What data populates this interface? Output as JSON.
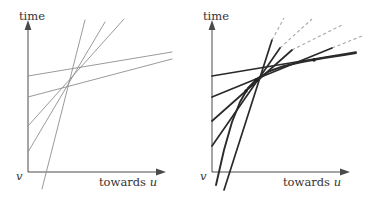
{
  "figure": {
    "panels": [
      {
        "id": "left",
        "name": "family-of-straight-lines",
        "axes": {
          "y_label": "time",
          "x_label_text": "towards ",
          "x_label_italic": "u",
          "origin_label": "v"
        },
        "lines": [
          {
            "name": "line-1-shallow",
            "x1": 28,
            "y1": 76,
            "x2": 172,
            "y2": 52
          },
          {
            "name": "line-2-shallow",
            "x1": 28,
            "y1": 97,
            "x2": 172,
            "y2": 59
          },
          {
            "name": "line-3-medium",
            "x1": 28,
            "y1": 126,
            "x2": 124,
            "y2": 19
          },
          {
            "name": "line-4-steep",
            "x1": 28,
            "y1": 152,
            "x2": 105,
            "y2": 22
          },
          {
            "name": "line-5-steepest",
            "x1": 42,
            "y1": 189,
            "x2": 85,
            "y2": 20
          }
        ]
      },
      {
        "id": "right",
        "name": "envelope-with-tangents",
        "axes": {
          "y_label": "time",
          "x_label_text": "towards ",
          "x_label_italic": "u",
          "origin_label": "v"
        },
        "envelope": {
          "name": "concave-envelope-curve",
          "points": "32,185 40,150 48,122 56,102 64,88 74,78 86,71 100,66 118,62 140,58 160,55 172,53"
        },
        "solid_tangents": [
          {
            "name": "tangent-solid-1",
            "x1": 28,
            "y1": 76,
            "x2": 172,
            "y2": 52
          },
          {
            "name": "tangent-solid-2",
            "x1": 28,
            "y1": 97,
            "x2": 148,
            "y2": 48
          },
          {
            "name": "tangent-solid-3",
            "x1": 28,
            "y1": 121,
            "x2": 108,
            "y2": 50
          },
          {
            "name": "tangent-solid-4",
            "x1": 28,
            "y1": 146,
            "x2": 96,
            "y2": 48
          },
          {
            "name": "tangent-solid-5",
            "x1": 40,
            "y1": 190,
            "x2": 88,
            "y2": 40
          }
        ],
        "dashed_extensions": [
          {
            "name": "dash-extension-1",
            "x1": 148,
            "y1": 48,
            "x2": 178,
            "y2": 36
          },
          {
            "name": "dash-extension-2",
            "x1": 108,
            "y1": 50,
            "x2": 158,
            "y2": 25
          },
          {
            "name": "dash-extension-3",
            "x1": 96,
            "y1": 48,
            "x2": 128,
            "y2": 19
          },
          {
            "name": "dash-extension-4",
            "x1": 88,
            "y1": 40,
            "x2": 100,
            "y2": 18
          }
        ],
        "tangent_points": [
          {
            "name": "tangency-point-1",
            "cx": 62,
            "cy": 91
          },
          {
            "name": "tangency-point-2",
            "cx": 72,
            "cy": 80
          },
          {
            "name": "tangency-point-3",
            "cx": 130,
            "cy": 60
          }
        ]
      }
    ]
  }
}
